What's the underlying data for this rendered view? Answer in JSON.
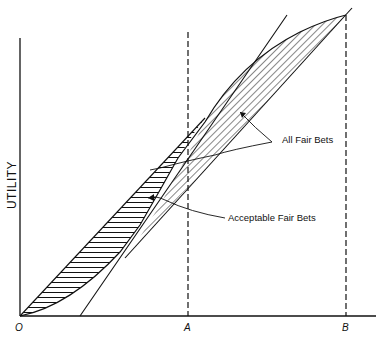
{
  "figure": {
    "ylabel": "UTILITY",
    "x_ticks": [
      {
        "label": "O",
        "x": 20
      },
      {
        "label": "A",
        "x": 188
      },
      {
        "label": "B",
        "x": 346
      }
    ],
    "annotations": {
      "all_fair_bets": "All Fair Bets",
      "acceptable_fair_bets": "Acceptable Fair Bets"
    },
    "colors": {
      "ink": "#111111",
      "background": "#ffffff"
    }
  }
}
